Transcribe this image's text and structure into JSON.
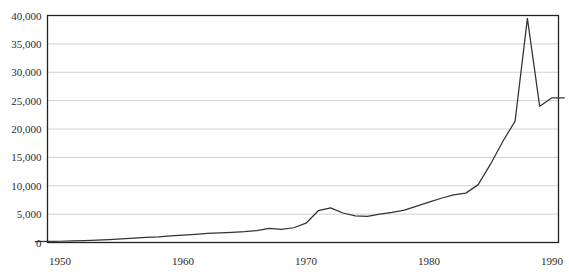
{
  "chart_data": {
    "type": "line",
    "title": "",
    "subtitle": "",
    "xlabel": "",
    "ylabel": "",
    "xlim": [
      1948,
      1991
    ],
    "ylim": [
      0,
      40000
    ],
    "grid": "horizontal",
    "legend": "none",
    "series_color": "#333333",
    "grid_color": "#cccccc",
    "frame_color": "#222222",
    "background": "#ffffff",
    "x_tick_labels": [
      "1950",
      "1960",
      "1970",
      "1980",
      "1990"
    ],
    "x_tick_values": [
      1950,
      1960,
      1970,
      1980,
      1990
    ],
    "y_tick_labels": [
      "0",
      "5,000",
      "10,000",
      "15,000",
      "20,000",
      "25,000",
      "30,000",
      "35,000",
      "40,000"
    ],
    "y_tick_values": [
      0,
      5000,
      10000,
      15000,
      20000,
      25000,
      30000,
      35000,
      40000
    ],
    "series": [
      {
        "name": "value",
        "x": [
          1948,
          1949,
          1950,
          1951,
          1952,
          1953,
          1954,
          1955,
          1956,
          1957,
          1958,
          1959,
          1960,
          1961,
          1962,
          1963,
          1964,
          1965,
          1966,
          1967,
          1968,
          1969,
          1970,
          1971,
          1972,
          1973,
          1974,
          1975,
          1976,
          1977,
          1978,
          1979,
          1980,
          1981,
          1982,
          1983,
          1984,
          1985,
          1986,
          1987,
          1988,
          1989,
          1990,
          1991
        ],
        "values": [
          150,
          180,
          220,
          280,
          340,
          420,
          520,
          640,
          780,
          900,
          1000,
          1150,
          1300,
          1450,
          1600,
          1700,
          1800,
          1900,
          2100,
          2500,
          2300,
          2600,
          3400,
          5600,
          6100,
          5200,
          4700,
          4600,
          5000,
          5300,
          5700,
          6400,
          7100,
          7800,
          8400,
          8700,
          10200,
          13800,
          17800,
          21400,
          39500,
          24000,
          25500,
          25500
        ]
      }
    ]
  }
}
